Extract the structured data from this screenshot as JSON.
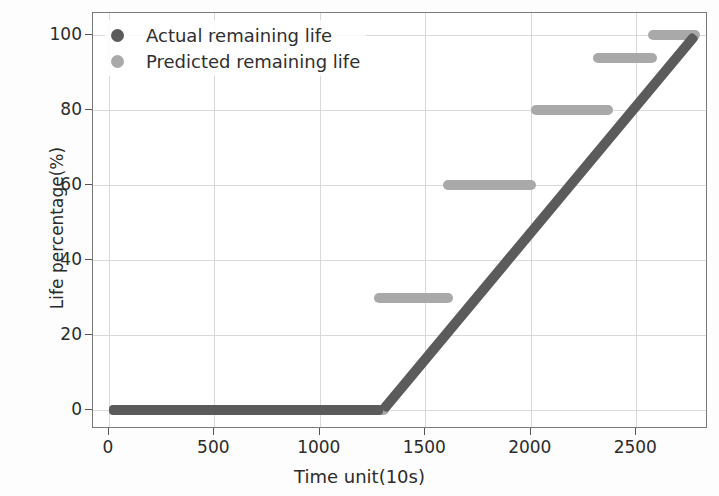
{
  "chart_data": {
    "type": "line",
    "title": "",
    "xlabel": "Time unit(10s)",
    "ylabel": "Life percentage(%)",
    "xlim": [
      -75,
      2840
    ],
    "ylim": [
      -5,
      106
    ],
    "xticks": [
      0,
      500,
      1000,
      1500,
      2000,
      2500
    ],
    "yticks": [
      0,
      20,
      40,
      60,
      80,
      100
    ],
    "grid": true,
    "legend_position": "upper left",
    "series": [
      {
        "name": "Actual remaining life",
        "color": "#5b5b5b",
        "style": "piecewise-linear",
        "points": [
          {
            "x": 0,
            "y": 0
          },
          {
            "x": 1300,
            "y": 0
          },
          {
            "x": 2780,
            "y": 100
          }
        ]
      },
      {
        "name": "Predicted remaining life",
        "color": "#a9a9a9",
        "style": "step-plateaus",
        "plateaus": [
          {
            "x_start": 0,
            "x_end": 1330,
            "y": 0
          },
          {
            "x_start": 1255,
            "x_end": 1630,
            "y": 30
          },
          {
            "x_start": 1585,
            "x_end": 2025,
            "y": 60
          },
          {
            "x_start": 2000,
            "x_end": 2390,
            "y": 80
          },
          {
            "x_start": 2295,
            "x_end": 2600,
            "y": 94
          },
          {
            "x_start": 2555,
            "x_end": 2800,
            "y": 100
          }
        ]
      }
    ]
  },
  "legend": {
    "items": [
      {
        "label": "Actual remaining life",
        "color": "#5b5b5b"
      },
      {
        "label": "Predicted remaining life",
        "color": "#a9a9a9"
      }
    ]
  },
  "axes": {
    "y_title": "Life percentage(%)",
    "x_title": "Time unit(10s)",
    "x_tick_labels": [
      "0",
      "500",
      "1000",
      "1500",
      "2000",
      "2500"
    ],
    "y_tick_labels": [
      "0",
      "20",
      "40",
      "60",
      "80",
      "100"
    ]
  }
}
